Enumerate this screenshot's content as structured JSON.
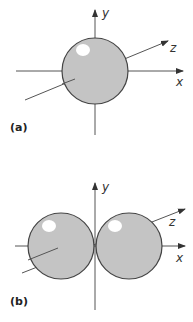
{
  "figure": {
    "panels": [
      {
        "label": "(a)",
        "description": "s orbital - single sphere",
        "axes": {
          "x": "x",
          "y": "y",
          "z": "z"
        }
      },
      {
        "label": "(b)",
        "description": "p orbital - two lobes along x axis",
        "axes": {
          "x": "x",
          "y": "y",
          "z": "z"
        }
      }
    ],
    "colors": {
      "lobe_fill": "#c4c4c4",
      "lobe_stroke": "#444444",
      "highlight": "#ffffff",
      "axis": "#555555"
    }
  }
}
